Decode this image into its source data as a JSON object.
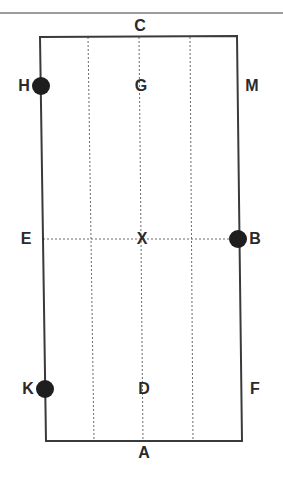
{
  "diagram": {
    "type": "dressage-arena",
    "colors": {
      "line": "#3a3a3a",
      "dashed": "#6a6a6a",
      "marker": "#1e1e1e",
      "text": "#2a2a2a",
      "background": "#ffffff"
    },
    "letters": [
      {
        "id": "C",
        "label": "C",
        "x": 140,
        "y": 26
      },
      {
        "id": "H",
        "label": "H",
        "x": 24,
        "y": 86
      },
      {
        "id": "G",
        "label": "G",
        "x": 141,
        "y": 86
      },
      {
        "id": "M",
        "label": "M",
        "x": 252,
        "y": 86
      },
      {
        "id": "E",
        "label": "E",
        "x": 26,
        "y": 239
      },
      {
        "id": "X",
        "label": "X",
        "x": 142,
        "y": 239
      },
      {
        "id": "B",
        "label": "B",
        "x": 255,
        "y": 239
      },
      {
        "id": "K",
        "label": "K",
        "x": 28,
        "y": 389
      },
      {
        "id": "D",
        "label": "D",
        "x": 144,
        "y": 389
      },
      {
        "id": "F",
        "label": "F",
        "x": 255,
        "y": 389
      },
      {
        "id": "A",
        "label": "A",
        "x": 144,
        "y": 453
      }
    ],
    "markers": [
      {
        "id": "H-marker",
        "x": 41,
        "y": 86,
        "r": 9
      },
      {
        "id": "B-marker",
        "x": 238,
        "y": 239,
        "r": 9
      },
      {
        "id": "K-marker",
        "x": 45,
        "y": 389,
        "r": 9
      }
    ],
    "arena": {
      "tl": [
        40,
        37
      ],
      "tr": [
        237,
        36
      ],
      "br": [
        242,
        441
      ],
      "bl": [
        46,
        441
      ]
    },
    "quarter_lines": [
      {
        "x1": 88,
        "y1": 37,
        "x2": 94,
        "y2": 441
      },
      {
        "x1": 139,
        "y1": 37,
        "x2": 143,
        "y2": 441
      },
      {
        "x1": 190,
        "y1": 37,
        "x2": 193,
        "y2": 441
      }
    ],
    "centre_line": {
      "x1": 43,
      "y1": 239,
      "x2": 239,
      "y2": 239
    },
    "top_rule": {
      "x1": 0,
      "y1": 13,
      "x2": 283,
      "y2": 13
    }
  }
}
